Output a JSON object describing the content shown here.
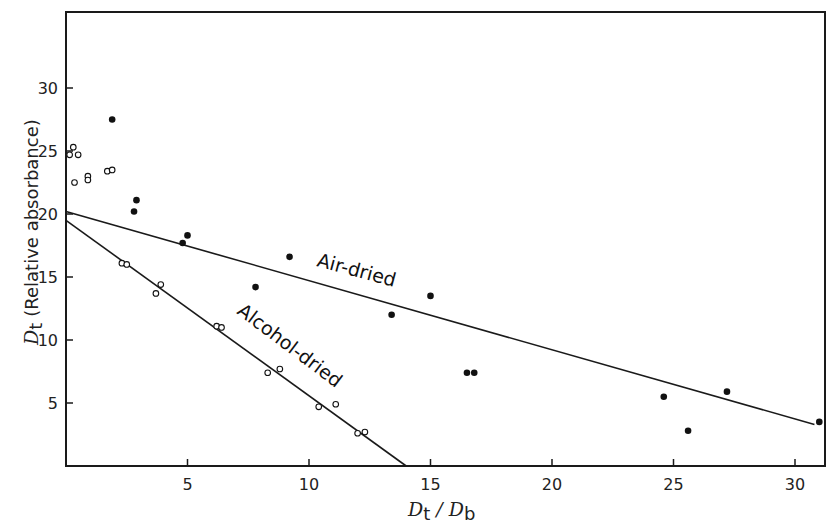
{
  "chart_data": {
    "type": "scatter",
    "title": "",
    "xlabel": "Dt / Db",
    "ylabel": "Dt (Relative absorbance)",
    "xlim": [
      0,
      31.2
    ],
    "ylim": [
      0,
      35.5
    ],
    "grid": false,
    "legend": "none (series labelled inline along fitted lines)",
    "x_ticks": [
      5,
      10,
      15,
      20,
      25,
      30
    ],
    "y_ticks": [
      5,
      10,
      15,
      20,
      25,
      30
    ],
    "series": [
      {
        "name": "Air-dried",
        "marker": "filled-circle",
        "points": [
          [
            1.9,
            27.5
          ],
          [
            2.9,
            21.1
          ],
          [
            2.8,
            20.2
          ],
          [
            5.0,
            18.3
          ],
          [
            4.8,
            17.7
          ],
          [
            9.2,
            16.6
          ],
          [
            7.8,
            14.2
          ],
          [
            15.0,
            13.5
          ],
          [
            13.4,
            12.0
          ],
          [
            16.5,
            7.4
          ],
          [
            16.8,
            7.4
          ],
          [
            24.6,
            5.5
          ],
          [
            25.6,
            2.8
          ],
          [
            27.2,
            5.9
          ],
          [
            31.0,
            3.5
          ]
        ],
        "fit_line": {
          "x": [
            0,
            30.8
          ],
          "y": [
            20.2,
            3.3
          ]
        }
      },
      {
        "name": "Alcohol-dried",
        "marker": "open-circle",
        "points": [
          [
            0.3,
            25.3
          ],
          [
            0.15,
            24.7
          ],
          [
            0.5,
            24.7
          ],
          [
            0.35,
            22.5
          ],
          [
            0.9,
            23.0
          ],
          [
            0.9,
            22.7
          ],
          [
            1.7,
            23.4
          ],
          [
            1.9,
            23.5
          ],
          [
            2.3,
            16.1
          ],
          [
            2.5,
            16.0
          ],
          [
            3.9,
            14.4
          ],
          [
            3.7,
            13.7
          ],
          [
            6.2,
            11.1
          ],
          [
            6.4,
            11.0
          ],
          [
            8.3,
            7.4
          ],
          [
            8.8,
            7.7
          ],
          [
            10.4,
            4.7
          ],
          [
            11.1,
            4.9
          ],
          [
            12.0,
            2.6
          ],
          [
            12.3,
            2.7
          ]
        ],
        "fit_line": {
          "x": [
            0,
            14.0
          ],
          "y": [
            19.5,
            0
          ]
        }
      }
    ],
    "annotations": [
      {
        "text": "Air-dried",
        "near": [
          11.5,
          15.5
        ],
        "rotation_deg": 15
      },
      {
        "text": "Alcohol-dried",
        "near": [
          7.5,
          9.5
        ],
        "rotation_deg": 36
      }
    ]
  },
  "axes": {
    "x_title_main": "D",
    "x_title_sub1": "t",
    "x_title_sep": " / ",
    "x_title_main2": "D",
    "x_title_sub2": "b",
    "y_title_main": "D",
    "y_title_sub": "t",
    "y_title_rest": "(Relative  absorbance)"
  },
  "labels": {
    "air": "Air-dried",
    "alcohol": "Alcohol-dried"
  }
}
